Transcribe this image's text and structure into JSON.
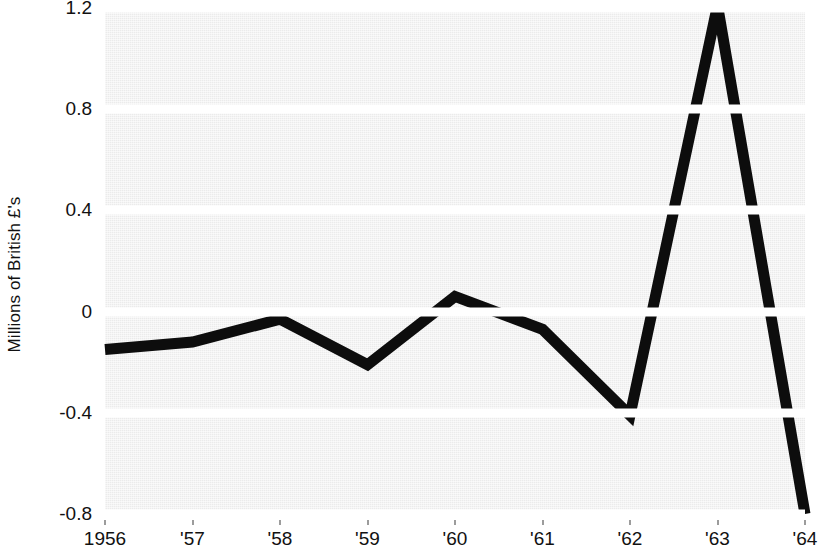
{
  "chart_data": {
    "type": "line",
    "title": "",
    "subtitle": "",
    "xlabel": "",
    "ylabel": "Millions of British £'s",
    "x": [
      1956,
      1957,
      1958,
      1959,
      1960,
      1961,
      1962,
      1963,
      1964
    ],
    "x_tick_labels": [
      "1956",
      "'57",
      "'58",
      "'59",
      "'60",
      "'61",
      "'62",
      "'63",
      "'64"
    ],
    "y_tick_labels": [
      "1.2",
      "0.8",
      "0.4",
      "0",
      "-0.4",
      "-0.8"
    ],
    "y_ticks": [
      1.2,
      0.8,
      0.4,
      0,
      -0.4,
      -0.8
    ],
    "ylim": [
      -0.8,
      1.2
    ],
    "grid": "horizontal-white-bands",
    "legend": "none",
    "series": [
      {
        "name": "Millions of British £'s",
        "color": "#0d0d0d",
        "line_width": 11,
        "values": [
          -0.15,
          -0.12,
          -0.03,
          -0.21,
          0.06,
          -0.07,
          -0.41,
          1.21,
          -0.8
        ]
      }
    ],
    "annotations": [],
    "plot_background": "#ebebeb",
    "gridline_color": "#ffffff",
    "axis_text_color": "#111111"
  }
}
